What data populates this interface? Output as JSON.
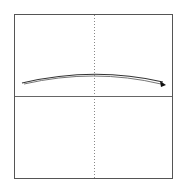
{
  "diagram": {
    "frame": {
      "x": 14,
      "y": 14,
      "width": 158,
      "height": 164,
      "stroke": "#555555"
    },
    "vertical_axis": {
      "x": 94,
      "style": "dotted",
      "stroke": "#888888"
    },
    "horizontal_axis": {
      "y": 96,
      "style": "solid",
      "stroke": "#666666"
    },
    "curves": [
      {
        "name": "trajectory-upper",
        "path": "M22,83 Q94,66 163,82",
        "stroke": "#333333"
      },
      {
        "name": "trajectory-lower",
        "path": "M24,84 Q94,68 161,84",
        "stroke": "#777777"
      }
    ],
    "arrowhead": {
      "tip": [
        166,
        85
      ],
      "fill": "#111111"
    }
  }
}
